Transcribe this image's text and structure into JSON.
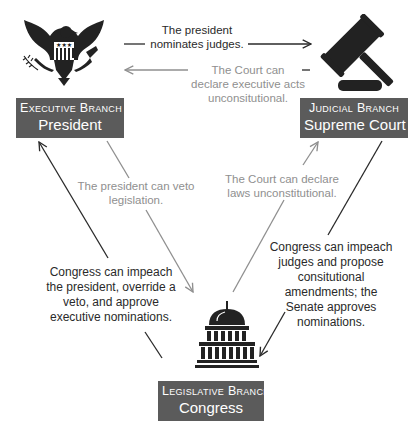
{
  "diagram": {
    "type": "checks-and-balances",
    "nodes": {
      "executive": {
        "branch": "Executive Branch",
        "who": "President",
        "icon": "eagle-seal-icon"
      },
      "judicial": {
        "branch": "Judicial Branch",
        "who": "Supreme Court",
        "icon": "gavel-icon"
      },
      "legislative": {
        "branch": "Legislative Branch",
        "who": "Congress",
        "icon": "capitol-icon"
      }
    },
    "edges": [
      {
        "from": "executive",
        "to": "judicial",
        "label": "The president nominates judges.",
        "lines": [
          "The president",
          "nominates judges."
        ],
        "style": "dark"
      },
      {
        "from": "judicial",
        "to": "executive",
        "label": "The Court can declare executive acts unconsitutional.",
        "lines": [
          "The Court can",
          "declare executive acts",
          "unconsitutional."
        ],
        "style": "light"
      },
      {
        "from": "executive",
        "to": "legislative",
        "label": "The president can veto legislation.",
        "lines": [
          "The president can veto",
          "legislation."
        ],
        "style": "light"
      },
      {
        "from": "legislative",
        "to": "judicial",
        "label": "The Court can declare laws unconstitutional.",
        "lines": [
          "The Court can declare",
          "laws unconstitutional."
        ],
        "style": "light"
      },
      {
        "from": "legislative",
        "to": "executive",
        "label": "Congress can impeach the president, override a veto, and approve executive nominations.",
        "lines": [
          "Congress can impeach",
          "the president, override a",
          "veto, and approve",
          "executive nominations."
        ],
        "style": "dark"
      },
      {
        "from": "judicial",
        "to": "legislative",
        "label": "Congress can impeach judges and propose consitutional amendments; the Senate approves nominations.",
        "lines": [
          "Congress can impeach",
          "judges and propose",
          "consitutional",
          "amendments; the",
          "Senate approves",
          "nominations."
        ],
        "style": "dark"
      }
    ],
    "colors": {
      "label_bg": "#5b5b5b",
      "label_text": "#ffffff",
      "dark": "#2a2a2a",
      "light": "#8f8f8f",
      "icon": "#222222"
    }
  }
}
